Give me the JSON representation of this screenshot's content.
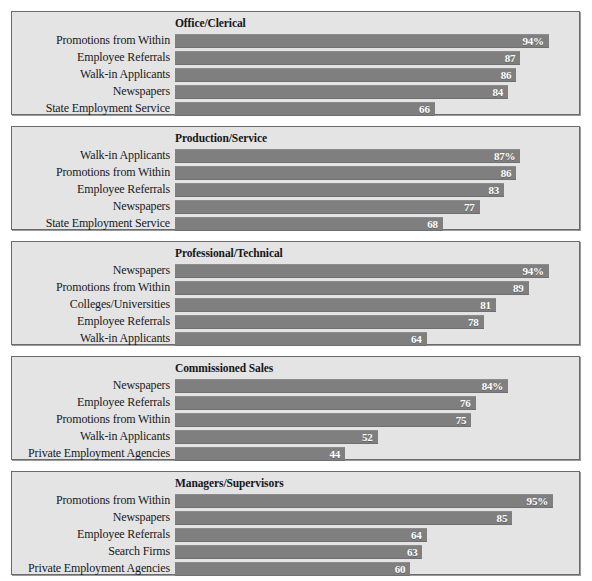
{
  "figure": {
    "background_color": "#ffffff",
    "panel_background_color": "#e4e4e4",
    "panel_border_color": "#6a6a6a",
    "bar_color": "#7f7f7f",
    "bar_label_color": "#ffffff",
    "text_color": "#17181b"
  },
  "chart_data": {
    "type": "bar",
    "title": "",
    "xlabel": "",
    "ylabel": "",
    "orientation": "horizontal",
    "grid": false,
    "legend": "none",
    "xlim": [
      0,
      100
    ],
    "units": "percent",
    "panels": [
      {
        "title": "Office/Clerical",
        "categories": [
          "Promotions from Within",
          "Employee Referrals",
          "Walk-in Applicants",
          "Newspapers",
          "State Employment Service"
        ],
        "values": [
          94,
          87,
          86,
          84,
          66
        ],
        "labels": [
          "94%",
          "87",
          "86",
          "84",
          "66"
        ]
      },
      {
        "title": "Production/Service",
        "categories": [
          "Walk-in Applicants",
          "Promotions from Within",
          "Employee Referrals",
          "Newspapers",
          "State Employment Service"
        ],
        "values": [
          87,
          86,
          83,
          77,
          68
        ],
        "labels": [
          "87%",
          "86",
          "83",
          "77",
          "68"
        ]
      },
      {
        "title": "Professional/Technical",
        "categories": [
          "Newspapers",
          "Promotions from Within",
          "Colleges/Universities",
          "Employee Referrals",
          "Walk-in Applicants"
        ],
        "values": [
          94,
          89,
          81,
          78,
          64
        ],
        "labels": [
          "94%",
          "89",
          "81",
          "78",
          "64"
        ]
      },
      {
        "title": "Commissioned Sales",
        "categories": [
          "Newspapers",
          "Employee Referrals",
          "Promotions from Within",
          "Walk-in Applicants",
          "Private Employment Agencies"
        ],
        "values": [
          84,
          76,
          75,
          52,
          44
        ],
        "labels": [
          "84%",
          "76",
          "75",
          "52",
          "44"
        ]
      },
      {
        "title": "Managers/Supervisors",
        "categories": [
          "Promotions from Within",
          "Newspapers",
          "Employee Referrals",
          "Search Firms",
          "Private Employment Agencies"
        ],
        "values": [
          95,
          85,
          64,
          63,
          60
        ],
        "labels": [
          "95%",
          "85",
          "64",
          "63",
          "60"
        ]
      }
    ]
  }
}
